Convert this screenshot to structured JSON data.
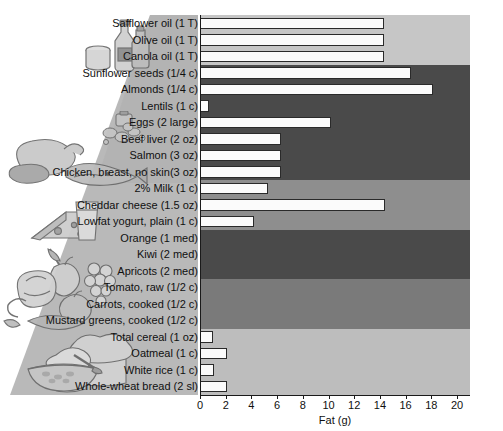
{
  "chart_data": {
    "type": "bar",
    "orientation": "horizontal",
    "title": "",
    "xlabel": "Fat (g)",
    "ylabel": "",
    "xlim": [
      0,
      20
    ],
    "xticks": [
      0,
      2,
      4,
      6,
      8,
      10,
      12,
      14,
      16,
      18,
      20
    ],
    "grid": false,
    "legend": null,
    "categories": [
      "Safflower oil (1 T)",
      "Olive oil (1 T)",
      "Canola oil (1 T)",
      "Sunflower seeds (1/4 c)",
      "Almonds (1/4 c)",
      "Lentils (1 c)",
      "Eggs (2 large)",
      "Beef liver (2 oz)",
      "Salmon (3 oz)",
      "Chicken, breast, no skin(3 oz)",
      "2% Milk (1 c)",
      "Cheddar cheese (1.5 oz)",
      "Lowfat yogurt, plain (1 c)",
      "Orange (1 med)",
      "Kiwi (2 med)",
      "Apricots (2 med)",
      "Tomato, raw (1/2 c)",
      "Carrots, cooked (1/2 c)",
      "Mustard greens, cooked (1/2 c)",
      "Total cereal (1 oz)",
      "Oatmeal (1 c)",
      "White rice (1 c)",
      "Whole-wheat bread (2 sl)"
    ],
    "values": [
      14.3,
      14.3,
      14.3,
      16.4,
      18.1,
      0.7,
      10.2,
      6.3,
      6.3,
      6.3,
      5.3,
      14.4,
      4.2,
      0,
      0,
      0,
      0,
      0,
      0,
      1.0,
      2.1,
      1.1,
      2.1
    ]
  },
  "bands": [
    {
      "name": "oils-band",
      "start_index": 0,
      "count": 3,
      "color": "#c6c6c6"
    },
    {
      "name": "protein-band",
      "start_index": 3,
      "count": 7,
      "color": "#4a4a4a"
    },
    {
      "name": "dairy-band",
      "start_index": 10,
      "count": 3,
      "color": "#8e8e8e"
    },
    {
      "name": "fruit-band",
      "start_index": 13,
      "count": 3,
      "color": "#4a4a4a"
    },
    {
      "name": "vegetable-band",
      "start_index": 16,
      "count": 3,
      "color": "#7a7a7a"
    },
    {
      "name": "grains-band",
      "start_index": 19,
      "count": 4,
      "color": "#bdbdbd"
    }
  ],
  "colors": {
    "bar_fill": "#fbfbfb",
    "bar_stroke": "#2a2a2a",
    "axis": "#1a1a1a",
    "text": "#101010",
    "gutter_art": "#b9b9b9",
    "page_background": "#ffffff"
  },
  "artwork": [
    {
      "name": "oils-artwork",
      "label": "bottle-and-jar-icon"
    },
    {
      "name": "legumes-artwork",
      "label": "lentils-icon"
    },
    {
      "name": "protein-artwork",
      "label": "poultry-fish-meat-icon"
    },
    {
      "name": "dairy-artwork",
      "label": "cheese-and-milk-icon"
    },
    {
      "name": "produce-artwork",
      "label": "fruits-and-vegetables-icon"
    },
    {
      "name": "grains-artwork",
      "label": "bread-and-cereal-bowl-icon"
    }
  ],
  "axis": {
    "tick_labels": [
      "0",
      "2",
      "4",
      "6",
      "8",
      "10",
      "12",
      "14",
      "16",
      "18",
      "20"
    ],
    "title": "Fat (g)"
  }
}
